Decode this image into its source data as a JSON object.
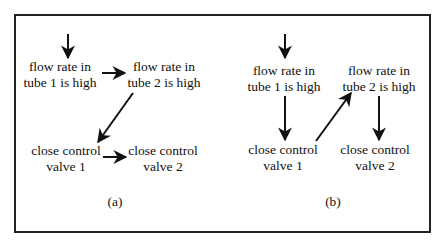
{
  "figure": {
    "panels": [
      {
        "caption": "(a)",
        "nodes": {
          "flow1": {
            "line1": "flow rate in",
            "line2": "tube 1 is high"
          },
          "flow2": {
            "line1": "flow rate in",
            "line2": "tube 2 is high"
          },
          "valve1": {
            "line1": "close control",
            "line2": "valve 1"
          },
          "valve2": {
            "line1": "close control",
            "line2": "valve 2"
          }
        },
        "edges": [
          {
            "from": "entry",
            "to": "flow1"
          },
          {
            "from": "flow1",
            "to": "flow2"
          },
          {
            "from": "flow2",
            "to": "valve1"
          },
          {
            "from": "valve1",
            "to": "valve2"
          }
        ]
      },
      {
        "caption": "(b)",
        "nodes": {
          "flow1": {
            "line1": "flow rate in",
            "line2": "tube 1 is high"
          },
          "flow2": {
            "line1": "flow rate in",
            "line2": "tube 2 is high"
          },
          "valve1": {
            "line1": "close control",
            "line2": "valve 1"
          },
          "valve2": {
            "line1": "close control",
            "line2": "valve 2"
          }
        },
        "edges": [
          {
            "from": "entry",
            "to": "flow1"
          },
          {
            "from": "flow1",
            "to": "valve1"
          },
          {
            "from": "valve1",
            "to": "flow2"
          },
          {
            "from": "flow2",
            "to": "valve2"
          }
        ]
      }
    ]
  }
}
